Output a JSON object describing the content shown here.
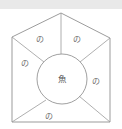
{
  "figure": {
    "background_color": "#ffffff",
    "stroke_color": "#8a8a8a",
    "label_color": "#6e6e6e",
    "top_band_color": "#e9e9e9"
  },
  "center": {
    "label": "魚",
    "cx": 62,
    "cy": 79,
    "r": 25
  },
  "regions": [
    {
      "id": "top-left",
      "label": "の",
      "x": 36,
      "y": 42
    },
    {
      "id": "top-right",
      "label": "の",
      "x": 73,
      "y": 42
    },
    {
      "id": "left",
      "label": "の",
      "x": 21,
      "y": 66
    },
    {
      "id": "right",
      "label": "の",
      "x": 92,
      "y": 84
    },
    {
      "id": "bottom",
      "label": "の",
      "x": 45,
      "y": 119
    }
  ],
  "outline": {
    "name": "pentagon-house-outline",
    "points": "61,13 110,38 110,122 12,122 12,37"
  },
  "dividers": [
    {
      "id": "apex-spoke",
      "d": "M 61,13 L 61,54"
    },
    {
      "id": "left-corner-spoke",
      "d": "M 12,37 L 44,62"
    },
    {
      "id": "right-corner-spoke",
      "d": "M 110,38 L 80,62"
    },
    {
      "id": "bottom-left-spoke",
      "d": "M 12,122 L 46,100"
    },
    {
      "id": "bottom-right-spoke",
      "d": "M 110,122 L 79,96"
    }
  ]
}
